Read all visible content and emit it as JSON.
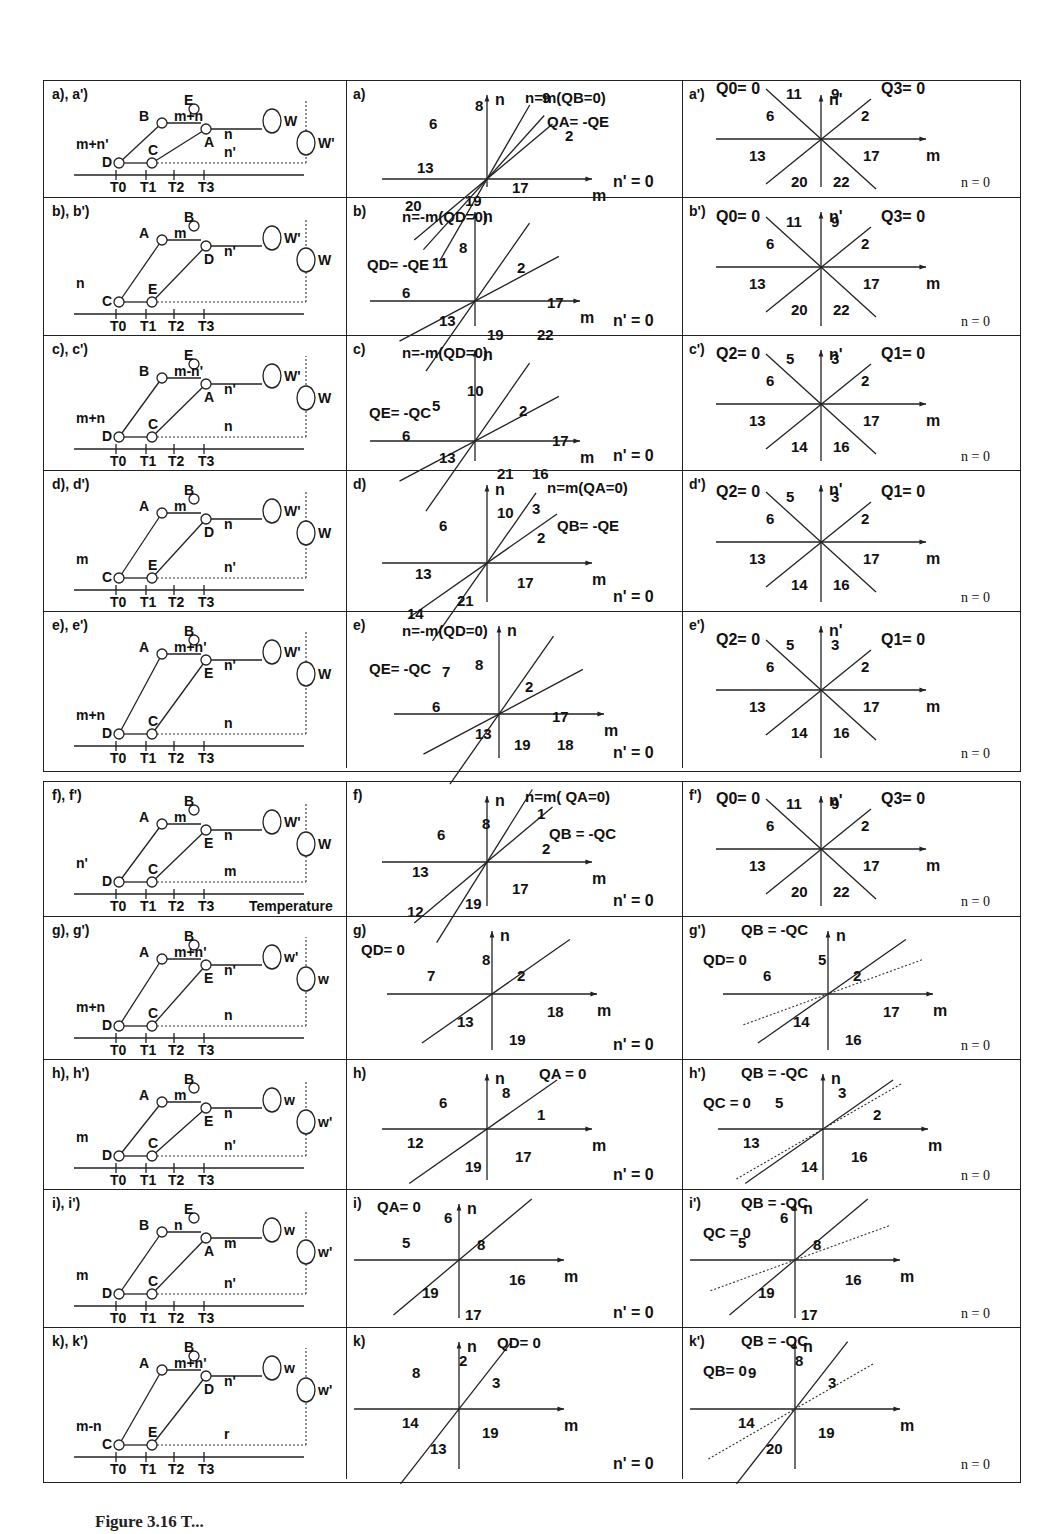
{
  "figure": {
    "caption_visible": "Figure 3.16 Temperature ... (caption truncated at bottom edge)",
    "caption_prefix": "Figure 3.16",
    "caption_rest": "T..."
  },
  "axes": {
    "m": "m",
    "n": "n",
    "n_prime": "n'"
  },
  "rows": [
    {
      "id": "a",
      "schematic": {
        "label": "a), a')",
        "nodes": [
          "E",
          "B",
          "A",
          "D",
          "C"
        ],
        "flows": [
          "m+n",
          "n",
          "m+n'",
          "n'"
        ],
        "wheels": [
          "W",
          "W'"
        ],
        "ticks": [
          "T0",
          "T1",
          "T2",
          "T3"
        ]
      },
      "plot": {
        "label": "a)",
        "top_note": "n=m(QB=0)",
        "side_note": "QA= -QE",
        "regions": [
          "6",
          "8",
          "9",
          "2",
          "13",
          "17",
          "19",
          "20"
        ],
        "axis_x": "m",
        "axis_y": "n",
        "condition": "n' = 0"
      },
      "plot_prime": {
        "label": "a')",
        "left_note": "Q0= 0",
        "right_note": "Q3= 0",
        "regions": [
          "11",
          "9",
          "6",
          "2",
          "13",
          "17",
          "20",
          "22"
        ],
        "axis_x": "m",
        "axis_y": "n'",
        "condition": "n = 0"
      }
    },
    {
      "id": "b",
      "schematic": {
        "label": "b), b')",
        "nodes": [
          "B",
          "A",
          "D",
          "C",
          "E"
        ],
        "flows": [
          "m",
          "n'",
          "n"
        ],
        "wheels": [
          "W'",
          "W"
        ],
        "ticks": [
          "T0",
          "T1",
          "T2",
          "T3"
        ]
      },
      "plot": {
        "label": "b)",
        "top_note": "n=-m(QD=0)",
        "side_note": "QD= -QE",
        "regions": [
          "11",
          "8",
          "2",
          "6",
          "17",
          "13",
          "19",
          "22"
        ],
        "axis_x": "m",
        "axis_y": "n",
        "condition": "n' = 0"
      },
      "plot_prime": {
        "label": "b')",
        "left_note": "Q0= 0",
        "right_note": "Q3= 0",
        "regions": [
          "11",
          "9",
          "6",
          "2",
          "13",
          "17",
          "20",
          "22"
        ],
        "axis_x": "m",
        "axis_y": "n'",
        "condition": "n = 0"
      }
    },
    {
      "id": "c",
      "schematic": {
        "label": "c), c')",
        "nodes": [
          "E",
          "B",
          "A",
          "D",
          "C"
        ],
        "flows": [
          "m-n'",
          "n'",
          "m+n",
          "n"
        ],
        "wheels": [
          "W'",
          "W"
        ],
        "ticks": [
          "T0",
          "T1",
          "T2",
          "T3"
        ]
      },
      "plot": {
        "label": "c)",
        "top_note": "n=-m(QD=0)",
        "side_note": "QE= -QC",
        "regions": [
          "5",
          "10",
          "2",
          "6",
          "17",
          "13",
          "21",
          "16"
        ],
        "axis_x": "m",
        "axis_y": "n",
        "condition": "n' = 0"
      },
      "plot_prime": {
        "label": "c')",
        "left_note": "Q2= 0",
        "right_note": "Q1= 0",
        "regions": [
          "5",
          "3",
          "6",
          "2",
          "13",
          "17",
          "14",
          "16"
        ],
        "axis_x": "m",
        "axis_y": "n'",
        "condition": "n = 0"
      }
    },
    {
      "id": "d",
      "schematic": {
        "label": "d), d')",
        "nodes": [
          "B",
          "A",
          "D",
          "C",
          "E"
        ],
        "flows": [
          "m",
          "n",
          "m",
          "n'"
        ],
        "wheels": [
          "W'",
          "W"
        ],
        "ticks": [
          "T0",
          "T1",
          "T2",
          "T3"
        ]
      },
      "plot": {
        "label": "d)",
        "top_note": "n=m(QA=0)",
        "side_note": "QB= -QE",
        "regions": [
          "6",
          "10",
          "3",
          "2",
          "13",
          "17",
          "21",
          "14"
        ],
        "axis_x": "m",
        "axis_y": "n",
        "condition": "n' = 0"
      },
      "plot_prime": {
        "label": "d')",
        "left_note": "Q2= 0",
        "right_note": "Q1= 0",
        "regions": [
          "5",
          "3",
          "6",
          "2",
          "13",
          "17",
          "14",
          "16"
        ],
        "axis_x": "m",
        "axis_y": "n'",
        "condition": "n = 0"
      }
    },
    {
      "id": "e",
      "schematic": {
        "label": "e), e')",
        "nodes": [
          "B",
          "A",
          "E",
          "D",
          "C"
        ],
        "flows": [
          "m+n'",
          "n'",
          "m+n",
          "n"
        ],
        "wheels": [
          "W'",
          "W"
        ],
        "ticks": [
          "T0",
          "T1",
          "T2",
          "T3"
        ]
      },
      "plot": {
        "label": "e)",
        "top_note": "n=-m(QD=0)",
        "side_note": "QE= -QC",
        "regions": [
          "7",
          "8",
          "2",
          "6",
          "17",
          "13",
          "19",
          "18"
        ],
        "axis_x": "m",
        "axis_y": "n",
        "condition": "n' = 0"
      },
      "plot_prime": {
        "label": "e')",
        "left_note": "Q2= 0",
        "right_note": "Q1= 0",
        "regions": [
          "5",
          "3",
          "6",
          "2",
          "13",
          "17",
          "14",
          "16"
        ],
        "axis_x": "m",
        "axis_y": "n'",
        "condition": "n = 0"
      }
    },
    {
      "id": "f",
      "schematic": {
        "label": "f), f')",
        "nodes": [
          "B",
          "A",
          "E",
          "D",
          "C"
        ],
        "flows": [
          "m",
          "n",
          "n'",
          "m"
        ],
        "wheels": [
          "W'",
          "W"
        ],
        "ticks": [
          "T0",
          "T1",
          "T2",
          "T3"
        ],
        "axis_title": "Temperature"
      },
      "plot": {
        "label": "f)",
        "top_note": "n=m( QA=0)",
        "side_note": "QB = -QC",
        "regions": [
          "6",
          "8",
          "1",
          "2",
          "13",
          "17",
          "19",
          "12"
        ],
        "axis_x": "m",
        "axis_y": "n",
        "condition": "n' = 0"
      },
      "plot_prime": {
        "label": "f')",
        "left_note": "Q0= 0",
        "right_note": "Q3= 0",
        "regions": [
          "11",
          "9",
          "6",
          "2",
          "13",
          "17",
          "20",
          "22"
        ],
        "axis_x": "m",
        "axis_y": "n'",
        "condition": "n = 0"
      }
    },
    {
      "id": "g",
      "schematic": {
        "label": "g), g')",
        "nodes": [
          "B",
          "A",
          "E",
          "D",
          "C"
        ],
        "flows": [
          "m+n'",
          "n'",
          "m+n",
          "n"
        ],
        "wheels": [
          "w'",
          "w"
        ],
        "ticks": [
          "T0",
          "T1",
          "T2",
          "T3"
        ]
      },
      "plot": {
        "label": "g)",
        "top_note": "QD= 0",
        "side_note": "",
        "regions": [
          "8",
          "7",
          "2",
          "13",
          "18",
          "19"
        ],
        "axis_x": "m",
        "axis_y": "n",
        "condition": "n' = 0"
      },
      "plot_prime": {
        "label": "g')",
        "left_note": "QD= 0",
        "right_note": "QB = -QC",
        "regions": [
          "5",
          "6",
          "2",
          "14",
          "17",
          "16"
        ],
        "axis_x": "m",
        "axis_y": "n",
        "condition": "n = 0"
      }
    },
    {
      "id": "h",
      "schematic": {
        "label": "h), h')",
        "nodes": [
          "B",
          "A",
          "E",
          "D",
          "C"
        ],
        "flows": [
          "m",
          "n",
          "m",
          "n'"
        ],
        "wheels": [
          "w",
          "w'"
        ],
        "ticks": [
          "T0",
          "T1",
          "T2",
          "T3"
        ]
      },
      "plot": {
        "label": "h)",
        "top_note": "QA = 0",
        "side_note": "",
        "regions": [
          "6",
          "8",
          "1",
          "12",
          "17",
          "19"
        ],
        "axis_x": "m",
        "axis_y": "n",
        "condition": "n' = 0"
      },
      "plot_prime": {
        "label": "h')",
        "left_note": "QC = 0",
        "right_note": "QB = -QC",
        "regions": [
          "5",
          "3",
          "2",
          "13",
          "16",
          "14"
        ],
        "axis_x": "m",
        "axis_y": "n",
        "condition": "n = 0"
      }
    },
    {
      "id": "i",
      "schematic": {
        "label": "i), i')",
        "nodes": [
          "E",
          "B",
          "A",
          "D",
          "C"
        ],
        "flows": [
          "n",
          "m",
          "m",
          "n'"
        ],
        "wheels": [
          "w",
          "w'"
        ],
        "ticks": [
          "T0",
          "T1",
          "T2",
          "T3"
        ]
      },
      "plot": {
        "label": "i)",
        "top_note": "QA= 0",
        "side_note": "",
        "regions": [
          "6",
          "5",
          "8",
          "19",
          "16",
          "17"
        ],
        "axis_x": "m",
        "axis_y": "n",
        "condition": "n' = 0"
      },
      "plot_prime": {
        "label": "i')",
        "left_note": "QC = 0",
        "right_note": "QB = -QC",
        "regions": [
          "6",
          "5",
          "8",
          "19",
          "16",
          "17"
        ],
        "axis_x": "m",
        "axis_y": "n",
        "condition": "n = 0"
      }
    },
    {
      "id": "k",
      "schematic": {
        "label": "k), k')",
        "nodes": [
          "B",
          "A",
          "D",
          "C",
          "E"
        ],
        "flows": [
          "m+n'",
          "n'",
          "m-n",
          "r"
        ],
        "wheels": [
          "w",
          "w'"
        ],
        "ticks": [
          "T0",
          "T1",
          "T2",
          "T3"
        ]
      },
      "plot": {
        "label": "k)",
        "top_note": "QD= 0",
        "side_note": "",
        "regions": [
          "8",
          "2",
          "3",
          "14",
          "19",
          "13"
        ],
        "axis_x": "m",
        "axis_y": "n",
        "condition": "n' = 0"
      },
      "plot_prime": {
        "label": "k')",
        "left_note": "QB= 0",
        "right_note": "QB = -QC",
        "regions": [
          "9",
          "8",
          "3",
          "14",
          "19",
          "20"
        ],
        "axis_x": "m",
        "axis_y": "n",
        "condition": "n = 0"
      }
    }
  ]
}
